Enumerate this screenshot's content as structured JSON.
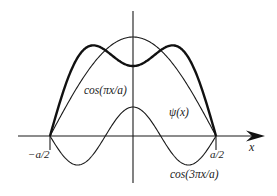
{
  "diagram": {
    "colors": {
      "ink": "#1a1a1a",
      "background": "#ffffff"
    },
    "geometry": {
      "origin_x": 133,
      "origin_y": 136,
      "half_width_px": 83,
      "x_axis_start": 18,
      "x_axis_end": 265,
      "y_axis_top": 11,
      "y_axis_bottom": 183,
      "tick_bottom": 150
    },
    "curves": [
      {
        "id": "cos1",
        "label": "cos(πx/a)",
        "harmonic": 1,
        "amplitude_px": 99,
        "style": "thin"
      },
      {
        "id": "cos3",
        "label": "cos(3πx/a)",
        "harmonic": 3,
        "amplitude_px": 29,
        "style": "thin"
      },
      {
        "id": "psi",
        "label": "ψ(x)",
        "combination": [
          {
            "harmonic": 1,
            "amplitude_px": 99
          },
          {
            "harmonic": 3,
            "amplitude_px": -29
          }
        ],
        "style": "thick"
      }
    ],
    "labels": {
      "cos1": {
        "text": "cos(πx/a)",
        "x": 84,
        "y": 94
      },
      "psi": {
        "text": "ψ(x)",
        "x": 169,
        "y": 116
      },
      "cos3": {
        "text": "cos(3πx/a)",
        "x": 170,
        "y": 178
      },
      "neg_half": {
        "text": "−a/2",
        "x": 28,
        "y": 158
      },
      "pos_half": {
        "text": "a/2",
        "x": 210,
        "y": 158
      },
      "x_axis": {
        "text": "x",
        "x": 249,
        "y": 151
      }
    }
  }
}
